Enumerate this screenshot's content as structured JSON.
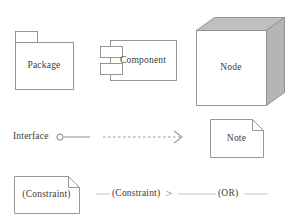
{
  "diagram": {
    "background_color": "#ffffff",
    "stroke_color": "#8c8c8c",
    "text_color": "#3a3a3a",
    "shade_top_color": "#bfbfbf",
    "shade_side_color": "#b5b5b5"
  },
  "shapes": {
    "package": {
      "label": "Package",
      "type": "package-symbol"
    },
    "component": {
      "label": "Component",
      "type": "component-symbol"
    },
    "node": {
      "label": "Node",
      "type": "node-3d-box"
    },
    "note": {
      "label": "Note",
      "type": "note-folded-corner"
    },
    "constraint_note": {
      "label": "(Constraint)",
      "type": "note-folded-corner"
    }
  },
  "connectors": {
    "interface": {
      "label": "Interface",
      "type": "lollipop-interface"
    },
    "dependency": {
      "label": "",
      "type": "dashed-open-arrow"
    },
    "constraint_link": {
      "label": "(Constraint)",
      "separator": ">",
      "type": "constraint-annotation"
    },
    "or_link": {
      "label": "(OR)",
      "type": "or-annotation"
    }
  }
}
